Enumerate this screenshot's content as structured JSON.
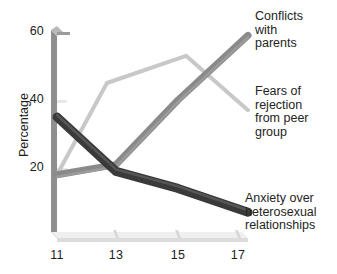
{
  "chart_data": {
    "type": "line",
    "title": "",
    "xlabel": "",
    "ylabel": "Percentage",
    "x": [
      11,
      13,
      15,
      17
    ],
    "xticks": [
      "11",
      "13",
      "15",
      "17"
    ],
    "yticks": [
      "20",
      "40",
      "60"
    ],
    "xlim": [
      11,
      17
    ],
    "ylim": [
      0,
      60
    ],
    "grid": false,
    "legend_position": "inline-right-annotations",
    "series": [
      {
        "name": "Conflicts with parents",
        "name_lines": [
          "Conflicts",
          "with",
          "parents"
        ],
        "values": [
          18,
          21,
          40,
          59
        ],
        "color": "#8a8a8a"
      },
      {
        "name": "Fears of rejection from peer group",
        "name_lines": [
          "Fears of",
          "rejection",
          "from peer",
          "group"
        ],
        "values": [
          18,
          45,
          53,
          37
        ],
        "color": "#c8c8c8"
      },
      {
        "name": "Anxiety over heterosexual relationships",
        "name_lines": [
          "Anxiety over",
          "heterosexual",
          "relationships"
        ],
        "values": [
          35,
          19,
          14,
          7
        ],
        "color": "#3a3a3a"
      }
    ],
    "axis_color": "#8f8f8f"
  }
}
